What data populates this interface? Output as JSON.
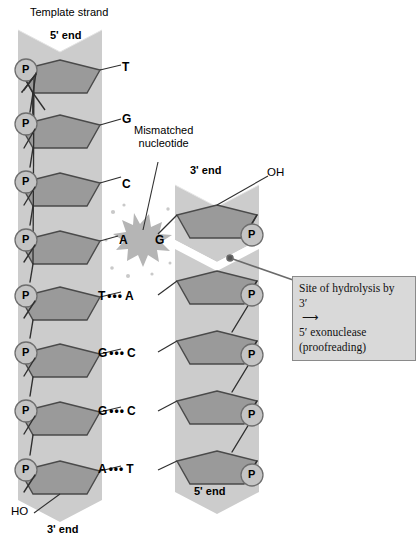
{
  "figure": {
    "template_label": "Template strand",
    "mismatch_label_line1": "Mismatched",
    "mismatch_label_line2": "nucleotide"
  },
  "template_strand": {
    "name": "Template strand",
    "top_end_label": "5' end",
    "bottom_end_label": "3' end",
    "terminal_hydroxyl": "HO",
    "phosphate_label": "P",
    "phosphate_count": 8,
    "bases": [
      "T",
      "G",
      "C",
      "A",
      "T",
      "G",
      "G",
      "A"
    ]
  },
  "new_strand": {
    "top_end_label": "3' end",
    "bottom_end_label": "5' end",
    "terminal_hydroxyl": "OH",
    "phosphate_label": "P",
    "phosphate_count": 5,
    "bases": [
      "G",
      "A",
      "C",
      "C",
      "T"
    ]
  },
  "base_pairs": [
    {
      "template": "T",
      "bond": "",
      "new": "",
      "paired": false
    },
    {
      "template": "G",
      "bond": "",
      "new": "",
      "paired": false
    },
    {
      "template": "C",
      "bond": "",
      "new": "",
      "paired": false
    },
    {
      "template": "A",
      "bond": "",
      "new": "G",
      "paired": false,
      "mismatch": true
    },
    {
      "template": "T",
      "bond": "•••",
      "new": "A",
      "paired": true
    },
    {
      "template": "G",
      "bond": "•••",
      "new": "C",
      "paired": true
    },
    {
      "template": "G",
      "bond": "•••",
      "new": "C",
      "paired": true
    },
    {
      "template": "A",
      "bond": "•••",
      "new": "T",
      "paired": true
    }
  ],
  "callout": {
    "line1": "Site of hydrolysis by",
    "line2_pre": "3′",
    "line2_arrow": "⟶",
    "line2_post": "5′ exonuclease",
    "line3": "(proofreading)"
  },
  "colors": {
    "backbone": "#cccccc",
    "backbone_edge": "#bfbfbf",
    "sugar": "#9a9a9a",
    "sugar_stroke": "#4a4a4a",
    "phosphate_fill": "#c4c4c4",
    "phosphate_stroke": "#6e6e6e",
    "burst": "#b5b5b5",
    "callout_bg": "#d9d9d9",
    "callout_border": "#8a8a8a",
    "text": "#000000",
    "background": "#ffffff"
  }
}
